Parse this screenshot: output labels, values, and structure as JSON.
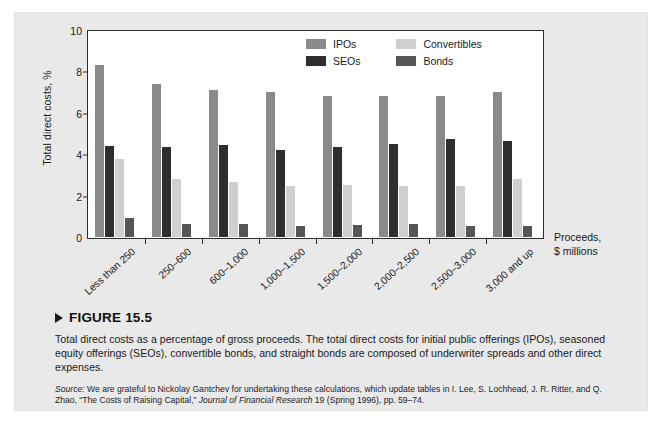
{
  "figure": {
    "marker_icon": "play-triangle-icon",
    "number_label": "FIGURE 15.5",
    "caption": "Total direct costs as a percentage of gross proceeds. The total direct costs for initial public offerings (IPOs), seasoned equity offerings (SEOs), convertible bonds, and straight bonds are composed of underwriter spreads and other direct expenses.",
    "source_prefix": "Source:",
    "source_part1": " We are grateful to Nickolay Gantchev for undertaking these calculations, which update tables in I. Lee, S. Lochhead, J. R. Ritter, and Q. Zhao, “The Costs of Raising Capital,” ",
    "source_journal": "Journal of Financial Research",
    "source_part2": " 19 (Spring 1996), pp. 59–74."
  },
  "axis_annotation": {
    "line1": "Proceeds,",
    "line2": "$ millions"
  },
  "colors": {
    "ipos": "#8a8a8a",
    "seos": "#2e2e2e",
    "convertibles": "#cfcfcf",
    "bonds": "#555555",
    "panel_bg": "#e9e9e9",
    "plot_bg": "#ffffff",
    "axis": "#2b2b2b",
    "text": "#1a1a1a"
  },
  "chart_data": {
    "type": "bar",
    "title": "",
    "xlabel": "Proceeds, $ millions",
    "ylabel": "Total direct costs, %",
    "ylim": [
      0,
      10
    ],
    "yticks": [
      0,
      2,
      4,
      6,
      8,
      10
    ],
    "ytick_labels": [
      "0",
      "2",
      "4",
      "6",
      "8",
      "10"
    ],
    "grid": false,
    "legend_position": "top-center-inside",
    "categories": [
      "Less than 250",
      "250–600",
      "600–1,000",
      "1,000–1,500",
      "1,500–2,000",
      "2,000–2,500",
      "2,500–3,000",
      "3,000 and up"
    ],
    "series": [
      {
        "name": "IPOs",
        "color": "#8a8a8a",
        "values": [
          8.3,
          7.4,
          7.1,
          7.0,
          6.8,
          6.8,
          6.8,
          7.0
        ]
      },
      {
        "name": "SEOs",
        "color": "#2e2e2e",
        "values": [
          4.4,
          4.35,
          4.45,
          4.2,
          4.35,
          4.5,
          4.75,
          4.65
        ]
      },
      {
        "name": "Convertibles",
        "color": "#cfcfcf",
        "values": [
          3.75,
          2.8,
          2.65,
          2.45,
          2.5,
          2.45,
          2.45,
          2.8
        ]
      },
      {
        "name": "Bonds",
        "color": "#555555",
        "values": [
          0.9,
          0.62,
          0.62,
          0.55,
          0.6,
          0.65,
          0.55,
          0.55
        ]
      }
    ]
  }
}
